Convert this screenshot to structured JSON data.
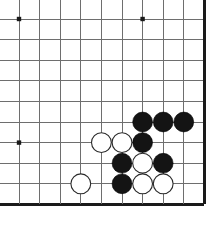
{
  "board": {
    "title": "Go board position",
    "type": "go-goban",
    "visible_columns": 10,
    "visible_rows": 10,
    "origin_x": 19,
    "origin_y": 19,
    "spacing": 20.6,
    "line_color": "#6e6e6e",
    "edge_color": "#1a1a1a",
    "background_color": "#ffffff",
    "edges": {
      "right_border": true,
      "bottom_border": true,
      "top_border": false,
      "left_border": false
    },
    "star_points": [
      {
        "col": 0,
        "row": 0
      },
      {
        "col": 6,
        "row": 0
      },
      {
        "col": 0,
        "row": 6
      }
    ],
    "stone_radius": 9.9,
    "black_label": "Black",
    "white_label": "White",
    "black_color": "#141414",
    "white_color": "#ffffff",
    "black_stones": [
      {
        "col": 6,
        "row": 5
      },
      {
        "col": 7,
        "row": 5
      },
      {
        "col": 8,
        "row": 5
      },
      {
        "col": 6,
        "row": 6
      },
      {
        "col": 5,
        "row": 7
      },
      {
        "col": 7,
        "row": 7
      },
      {
        "col": 5,
        "row": 8
      }
    ],
    "white_stones": [
      {
        "col": 4,
        "row": 6
      },
      {
        "col": 5,
        "row": 6
      },
      {
        "col": 6,
        "row": 7
      },
      {
        "col": 3,
        "row": 8
      },
      {
        "col": 6,
        "row": 8
      },
      {
        "col": 7,
        "row": 8
      }
    ]
  }
}
